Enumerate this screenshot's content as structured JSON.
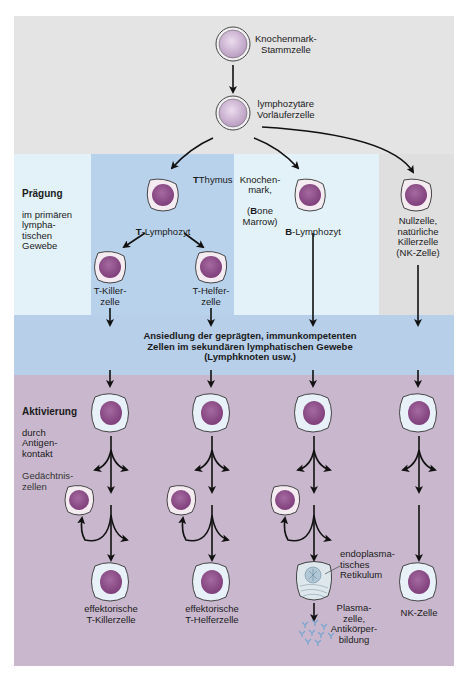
{
  "colors": {
    "top_gray": "#e4e4e4",
    "primary_light_cyan": "#e3f2f8",
    "thymus_blue": "#b9d2eb",
    "nullcell_gray": "#dfdfdf",
    "secondary_band_blue": "#b7cfe9",
    "activation_mauve": "#c9b8cd",
    "cell_nucleus": "#8e4f88",
    "stem_cell": "#cbb2d1"
  },
  "top": {
    "stem_cell_label": "Knochenmark-\nStammzelle",
    "progenitor_label": "lymphozytäre\nVorläuferzelle"
  },
  "primary": {
    "heading_bold": "Prägung",
    "heading_rest": "im primären\nlympha-\ntischen\nGewebe",
    "thymus_label": "Thymus",
    "thymus_bold_letter": "T",
    "bone_marrow_label_1": "Knochen-\nmark,",
    "bone_marrow_paren_open": "(",
    "bone_marrow_bold_letter": "B",
    "bone_marrow_rest": "one\nMarrow)",
    "t_lymphocyte_bold": "T",
    "t_lymphocyte_rest": "-Lymphozyt",
    "b_lymphocyte_bold": "B",
    "b_lymphocyte_rest": "-Lymphozyt",
    "t_killer_label": "T-Killer-\nzelle",
    "t_helper_label": "T-Helfer-\nzelle",
    "null_cell_label": "Nullzelle,\nnatürliche\nKillerzelle\n(NK-Zelle)"
  },
  "secondary": {
    "band_text": "Ansiedlung der geprägten, immunkompetenten\nZellen im sekundären lymphatischen Gewebe\n(Lymphknoten usw.)"
  },
  "activation": {
    "heading_bold": "Aktivierung",
    "heading_rest": "durch\nAntigen-\nkontakt",
    "memory_cells_label": "Gedächtnis-\nzellen",
    "effector_t_killer": "effektorische\nT-Killerzelle",
    "effector_t_helper": "effektorische\nT-Helferzelle",
    "er_label": "endoplasma-\ntisches\nRetikulum",
    "plasma_cell_label": "Plasma-\nzelle,\nAntikörper-\nbildung",
    "nk_cell_label": "NK-Zelle"
  }
}
